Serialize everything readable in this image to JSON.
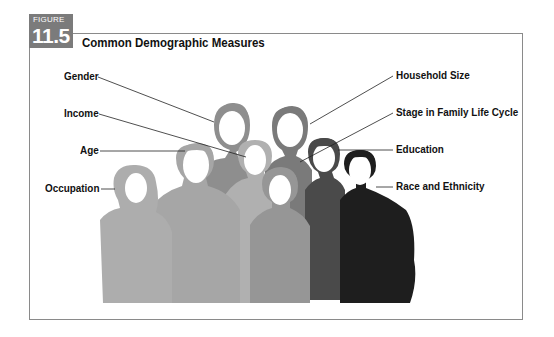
{
  "figure": {
    "label": "FIGURE",
    "number": "11.5",
    "title": "Common Demographic Measures"
  },
  "labels_left": [
    {
      "text": "Gender"
    },
    {
      "text": "Income"
    },
    {
      "text": "Age"
    },
    {
      "text": "Occupation"
    }
  ],
  "labels_right": [
    {
      "text": "Household Size"
    },
    {
      "text": "Stage in Family Life Cycle"
    },
    {
      "text": "Education"
    },
    {
      "text": "Race and Ethnicity"
    }
  ],
  "colors": {
    "badge": "#7b7b7b",
    "frame": "#8a8a8a",
    "silhouette_light": "#b5b5b5",
    "silhouette_mid": "#9c9c9c",
    "silhouette_dark": "#6e6e6e",
    "silhouette_darker": "#4a4a4a",
    "silhouette_darkest": "#1e1e1e"
  }
}
